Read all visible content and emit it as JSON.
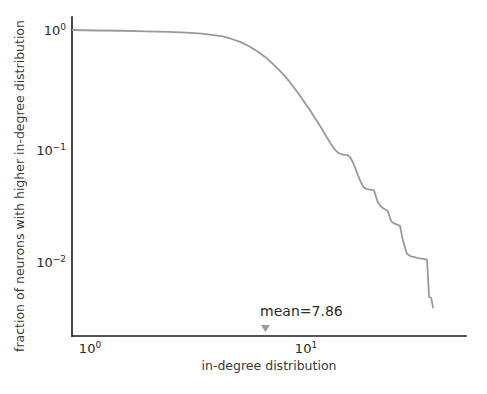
{
  "chart_data": {
    "type": "line",
    "title": "",
    "subtitle": "",
    "xlabel": "in-degree distribution",
    "ylabel": "fraction of neurons with higher in-degree distribution",
    "xscale": "log",
    "yscale": "log",
    "grid": false,
    "legend": null,
    "xlim": [
      1.0,
      52.0
    ],
    "ylim": [
      0.0032,
      1.15
    ],
    "x_tick_labels": [
      "10⁰",
      "10¹"
    ],
    "x_tick_values": [
      1,
      10
    ],
    "y_tick_labels": [
      "10⁰",
      "10⁻¹",
      "10⁻²"
    ],
    "y_tick_values": [
      1,
      0.1,
      0.01
    ],
    "line_color": "#9a9a9a",
    "series": [
      {
        "name": "in-degree complementary cumulative distribution",
        "x": [
          1.0,
          1.3,
          1.7,
          2.2,
          2.8,
          3.4,
          4.0,
          4.6,
          5.0,
          5.4,
          6.0,
          6.6,
          7.2,
          7.9,
          8.6,
          9.4,
          10.2,
          11.0,
          11.8,
          12.6,
          13.4,
          14.2,
          15.0,
          15.8,
          16.4,
          17.0,
          17.6,
          18.2,
          18.8,
          19.4,
          20.0,
          20.8,
          21.6,
          22.4,
          23.2,
          24.0,
          25.0,
          26.0,
          27.0,
          28.0,
          29.0,
          30.0,
          31.0,
          32.0,
          33.0,
          34.0,
          35.5,
          37.0,
          38.5,
          40.0,
          41.5,
          43.0,
          44.0,
          45.0,
          46.0,
          47.0
        ],
        "y": [
          1.0,
          0.99,
          0.985,
          0.975,
          0.965,
          0.95,
          0.93,
          0.9,
          0.88,
          0.845,
          0.79,
          0.725,
          0.655,
          0.58,
          0.5,
          0.425,
          0.355,
          0.295,
          0.245,
          0.205,
          0.172,
          0.145,
          0.122,
          0.104,
          0.094,
          0.088,
          0.085,
          0.084,
          0.0835,
          0.08,
          0.072,
          0.06,
          0.05,
          0.044,
          0.0425,
          0.042,
          0.0415,
          0.033,
          0.03,
          0.0285,
          0.0275,
          0.0225,
          0.0215,
          0.021,
          0.0205,
          0.0155,
          0.0118,
          0.0112,
          0.011,
          0.0108,
          0.0107,
          0.0106,
          0.0105,
          0.005,
          0.0049,
          0.004
        ]
      }
    ],
    "annotations": [
      {
        "name": "mean-annotation",
        "label": "mean=7.86",
        "value": 7.86,
        "marker": "triangle-down",
        "marker_color": "#9a9a9a"
      }
    ]
  },
  "axes": {
    "xlabel": "in-degree distribution",
    "ylabel": "fraction of neurons with higher in-degree distribution",
    "x_ticks": [
      {
        "mantissa": "10",
        "exponent": "0"
      },
      {
        "mantissa": "10",
        "exponent": "1"
      }
    ],
    "y_ticks": [
      {
        "mantissa": "10",
        "exponent": "0"
      },
      {
        "mantissa": "10",
        "exponent": "−1"
      },
      {
        "mantissa": "10",
        "exponent": "−2"
      }
    ]
  },
  "annotation": {
    "mean_label": "mean=7.86"
  }
}
